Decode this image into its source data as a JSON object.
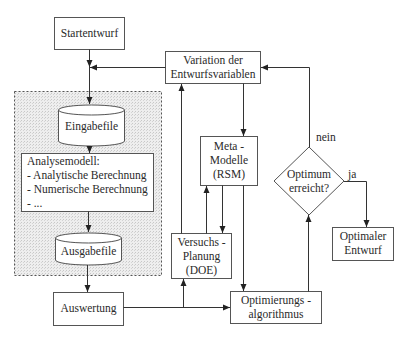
{
  "diagram": {
    "nodes": {
      "start": {
        "label": "Startentwurf"
      },
      "variation": {
        "line1": "Variation der",
        "line2": "Entwurfsvariablen"
      },
      "input_file": {
        "label": "Eingabefile"
      },
      "analysis_model": {
        "title": "Analysemodell:",
        "items": [
          "- Analytische Berechnung",
          "- Numerische Berechnung",
          "- ..."
        ]
      },
      "output_file": {
        "label": "Ausgabefile"
      },
      "evaluation": {
        "label": "Auswertung"
      },
      "meta_models": {
        "line1": "Meta -",
        "line2": "Modelle",
        "line3": "(RSM)"
      },
      "doe": {
        "line1": "Versuchs -",
        "line2": "Planung",
        "line3": "(DOE)"
      },
      "optimizer": {
        "line1": "Optimierungs  -",
        "line2": "algorithmus"
      },
      "decision": {
        "line1": "Optimum",
        "line2": "erreicht?"
      },
      "optimal": {
        "line1": "Optimaler",
        "line2": "Entwurf"
      }
    },
    "edge_labels": {
      "no": "nein",
      "yes": "ja"
    },
    "colors": {
      "line": "#333333",
      "box_border": "#555555",
      "shaded_fill": "#e6e6e6"
    }
  }
}
